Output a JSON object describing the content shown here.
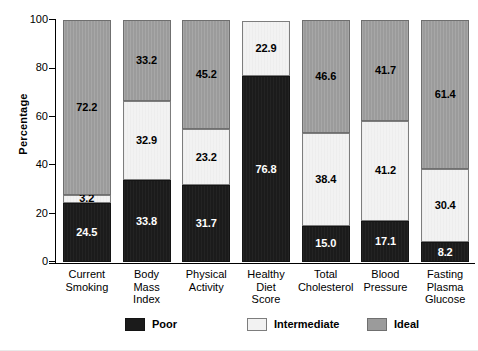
{
  "chart_data": {
    "type": "bar",
    "subtype": "stacked-bar-100-percent",
    "title": "",
    "xlabel": "",
    "ylabel": "Percentage",
    "ylim": [
      0,
      100
    ],
    "yticks": [
      0,
      20,
      40,
      60,
      80,
      100
    ],
    "ytick_labels": [
      "0",
      "20",
      "40",
      "60",
      "80",
      "100"
    ],
    "grid": false,
    "legend_position": "bottom",
    "categories": [
      "Current Smoking",
      "Body Mass Index",
      "Physical Activity",
      "Healthy Diet Score",
      "Total Cholesterol",
      "Blood Pressure",
      "Fasting Plasma Glucose"
    ],
    "category_label_lines": [
      [
        "Current",
        "Smoking"
      ],
      [
        "Body",
        "Mass",
        "Index"
      ],
      [
        "Physical",
        "Activity"
      ],
      [
        "Healthy",
        "Diet",
        "Score"
      ],
      [
        "Total",
        "Cholesterol"
      ],
      [
        "Blood",
        "Pressure"
      ],
      [
        "Fasting",
        "Plasma",
        "Glucose"
      ]
    ],
    "series": [
      {
        "name": "Poor",
        "color": "#1b1b1b",
        "values": [
          24.5,
          33.8,
          31.7,
          76.8,
          15.0,
          17.1,
          8.2
        ],
        "labels": [
          "24.5",
          "33.8",
          "31.7",
          "76.8",
          "15.0",
          "17.1",
          "8.2"
        ]
      },
      {
        "name": "Intermediate",
        "color": "#f2f2f2",
        "values": [
          3.2,
          32.9,
          23.2,
          22.9,
          38.4,
          41.2,
          30.4
        ],
        "labels": [
          "3.2",
          "32.9",
          "23.2",
          "22.9",
          "38.4",
          "41.2",
          "30.4"
        ]
      },
      {
        "name": "Ideal",
        "color": "#9b9b9b",
        "values": [
          72.2,
          33.2,
          45.2,
          0.0,
          46.6,
          41.7,
          61.4
        ],
        "labels": [
          "72.2",
          "33.2",
          "45.2",
          "",
          "46.6",
          "41.7",
          "61.4"
        ]
      }
    ]
  },
  "legend": {
    "items": [
      {
        "label": "Poor",
        "swatch": "sw-poor"
      },
      {
        "label": "Intermediate",
        "swatch": "sw-intermediate"
      },
      {
        "label": "Ideal",
        "swatch": "sw-ideal"
      }
    ]
  },
  "colors": {
    "poor": "#1b1b1b",
    "intermediate": "#f2f2f2",
    "ideal": "#9b9b9b",
    "axis": "#000000",
    "background": "#ffffff"
  }
}
